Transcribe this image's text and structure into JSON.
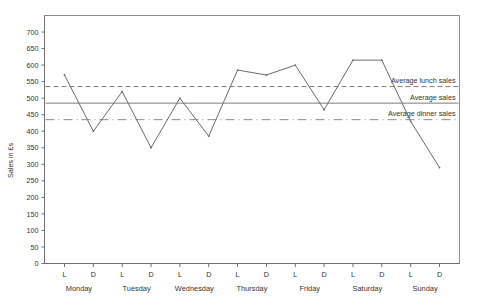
{
  "chart_data": {
    "type": "line",
    "title": "",
    "xlabel": "",
    "ylabel": "Sales in £s",
    "ylim": [
      0,
      750
    ],
    "ytick_step": 50,
    "yticks": [
      0,
      50,
      100,
      150,
      200,
      250,
      300,
      350,
      400,
      450,
      500,
      550,
      600,
      650,
      700
    ],
    "ytick_labels": [
      "0",
      "50",
      "100",
      "150",
      "200",
      "250",
      "300",
      "350",
      "400",
      "450",
      "500",
      "550",
      "600",
      "650",
      "700"
    ],
    "grid": false,
    "legend_position": "inside-right",
    "days": [
      "Monday",
      "Tuesday",
      "Wednesday",
      "Thursday",
      "Friday",
      "Saturday",
      "Sunday"
    ],
    "service_labels": [
      "L",
      "D"
    ],
    "x": [
      "L",
      "D",
      "L",
      "D",
      "L",
      "D",
      "L",
      "D",
      "L",
      "D",
      "L",
      "D",
      "L",
      "D"
    ],
    "categories": [
      "Monday L",
      "Monday D",
      "Tuesday L",
      "Tuesday D",
      "Wednesday L",
      "Wednesday D",
      "Thursday L",
      "Thursday D",
      "Friday L",
      "Friday D",
      "Saturday L",
      "Saturday D",
      "Sunday L",
      "Sunday D"
    ],
    "series": [
      {
        "name": "Sales",
        "values": [
          570,
          400,
          520,
          350,
          500,
          385,
          585,
          570,
          600,
          465,
          615,
          615,
          430,
          290
        ]
      }
    ],
    "reference_lines": [
      {
        "label": "Average lunch sales",
        "value": 535,
        "style": "dashed"
      },
      {
        "label": "Average sales",
        "value": 485,
        "style": "solid"
      },
      {
        "label": "Average dinner sales",
        "value": 435,
        "style": "dashdot"
      }
    ],
    "colors": {
      "data_line": "#6b6b6b",
      "reference_line": "#7c7c7c",
      "frame": "#8d8d8d",
      "text": "#333333",
      "background": "#ffffff"
    }
  }
}
